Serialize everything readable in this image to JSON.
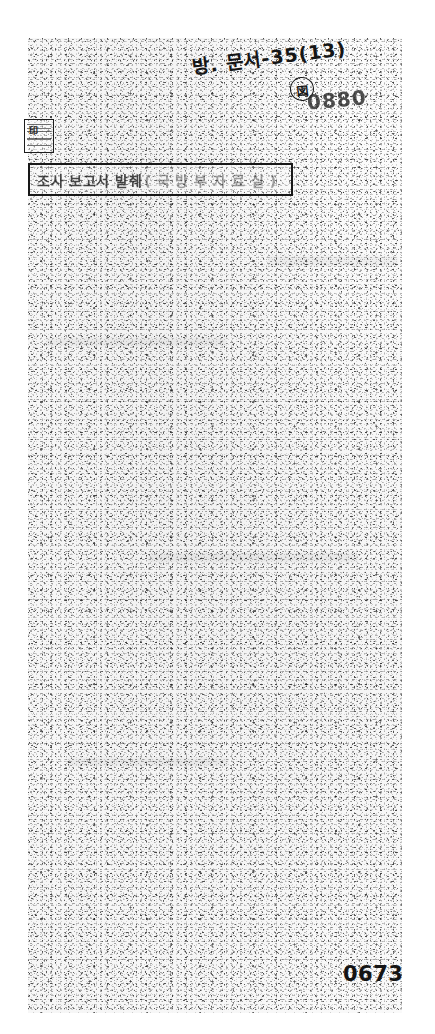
{
  "document": {
    "kind": "scanned-archival-page",
    "condition": "heavily degraded / speckled microfilm scan",
    "page_background_color": "#fbfbfb",
    "ink_color": "#151515",
    "margin_color": "#ffffff"
  },
  "annotations": {
    "handwritten_note": {
      "text": "방. 문서-35(13)",
      "circled_mark": "図",
      "note": "handwritten in ink at top of page, slanted"
    },
    "bleed_through_number": {
      "text": "0880",
      "note": "mirrored show-through from reverse side of the sheet"
    },
    "seal_stamp": {
      "label": "registry seal",
      "glyph": "印"
    }
  },
  "title_box": {
    "heading": "조사 보고서 발췌",
    "parenthetical": "( 국 방 부 자 료 실 )",
    "border_color": "#181818"
  },
  "footer": {
    "archive_number": "0673"
  }
}
